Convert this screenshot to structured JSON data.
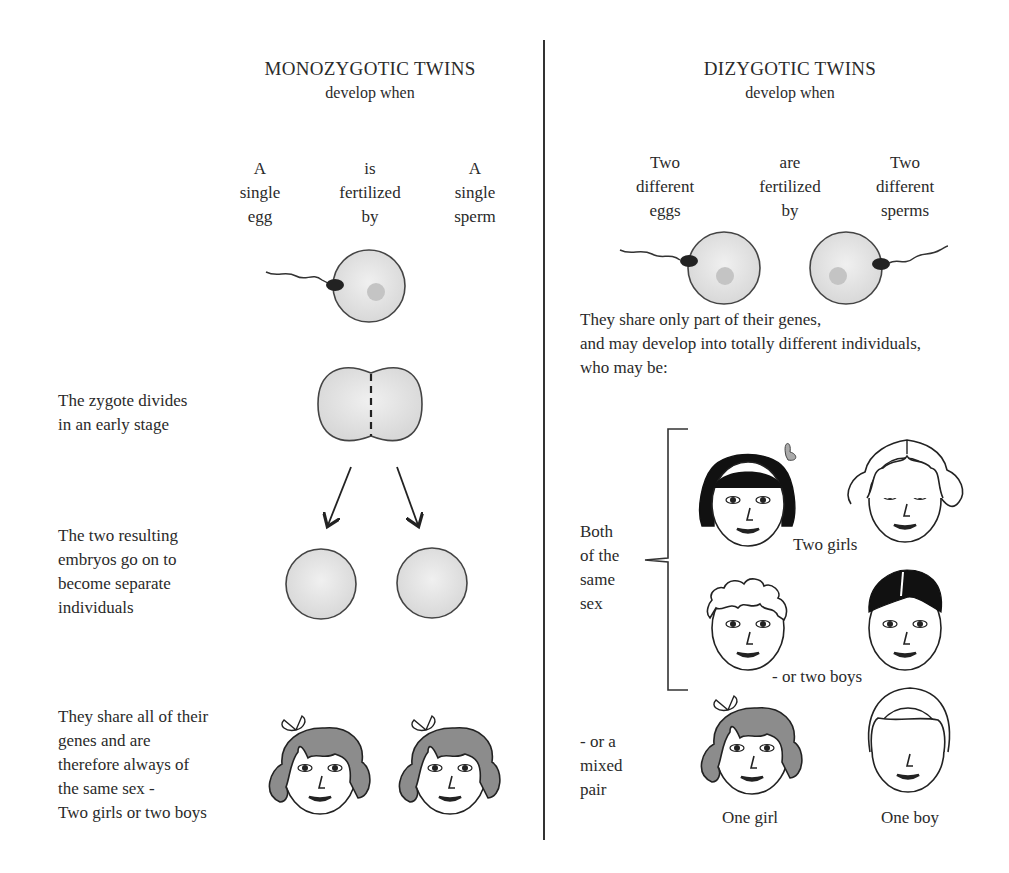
{
  "left": {
    "title": "MONOZYGOTIC TWINS",
    "subtitle": "develop when",
    "columns": [
      {
        "text": "A\nsingle\negg"
      },
      {
        "text": "is\nfertilized\nby"
      },
      {
        "text": "A\nsingle\nsperm"
      }
    ],
    "steps": [
      {
        "text": "The zygote divides\nin an early stage"
      },
      {
        "text": "The two resulting\nembryos go on to\nbecome separate\nindividuals"
      },
      {
        "text": "They share all of their\ngenes and are\ntherefore always of\nthe same sex -\nTwo girls or two boys"
      }
    ]
  },
  "right": {
    "title": "DIZYGOTIC TWINS",
    "subtitle": "develop when",
    "columns": [
      {
        "text": "Two\ndifferent\neggs"
      },
      {
        "text": "are\nfertilized\nby"
      },
      {
        "text": "Two\ndifferent\nsperms"
      }
    ],
    "description": "They share only part of their genes,\nand may develop into totally different individuals,\nwho may be:",
    "same_sex_label": "Both\nof the\nsame\nsex",
    "two_girls_label": "Two girls",
    "two_boys_label": "- or two boys",
    "mixed_label": "- or a\nmixed\npair",
    "one_girl_label": "One girl",
    "one_boy_label": "One boy"
  },
  "colors": {
    "egg_fill": "#e4e4e4",
    "nucleus": "#c4c4c4",
    "sperm_head": "#222222",
    "hair_gray": "#8c8c8c",
    "hair_black": "#111111",
    "line": "#333333"
  }
}
